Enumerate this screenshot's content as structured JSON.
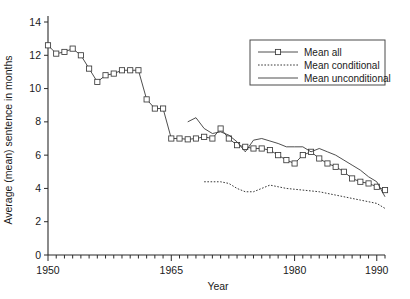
{
  "chart_data": {
    "type": "line",
    "title": "",
    "xlabel": "Year",
    "ylabel": "Average (mean) sentence in months",
    "xlim": [
      1950,
      1991
    ],
    "ylim": [
      0,
      14
    ],
    "xticks": [
      1950,
      1965,
      1980,
      1990
    ],
    "xtick_labels": [
      "1950",
      "1965",
      "1980",
      "1990"
    ],
    "x_minor_tick_interval": 1,
    "yticks": [
      0,
      2,
      4,
      6,
      8,
      10,
      12,
      14
    ],
    "ytick_labels": [
      "0",
      "2",
      "4",
      "6",
      "8",
      "10",
      "12",
      "14"
    ],
    "grid": false,
    "legend_position": "top-right",
    "series": [
      {
        "name": "Mean all",
        "style": "line-with-square-markers",
        "x": [
          1950,
          1951,
          1952,
          1953,
          1954,
          1955,
          1956,
          1957,
          1958,
          1959,
          1960,
          1961,
          1962,
          1963,
          1964,
          1965,
          1966,
          1967,
          1968,
          1969,
          1970,
          1971,
          1972,
          1973,
          1974,
          1975,
          1976,
          1977,
          1978,
          1979,
          1980,
          1981,
          1982,
          1983,
          1984,
          1985,
          1986,
          1987,
          1988,
          1989,
          1990,
          1991
        ],
        "values": [
          12.6,
          12.1,
          12.2,
          12.4,
          12.0,
          11.2,
          10.4,
          10.8,
          10.9,
          11.1,
          11.1,
          11.1,
          9.35,
          8.8,
          8.8,
          7.0,
          7.0,
          6.95,
          7.0,
          7.1,
          7.0,
          7.6,
          7.0,
          6.6,
          6.5,
          6.4,
          6.4,
          6.3,
          6.0,
          5.7,
          5.5,
          6.0,
          6.2,
          5.8,
          5.5,
          5.3,
          5.0,
          4.6,
          4.4,
          4.3,
          4.1,
          3.9
        ],
        "marker": "square"
      },
      {
        "name": "Mean conditional",
        "style": "dotted",
        "x": [
          1969,
          1970,
          1971,
          1972,
          1973,
          1974,
          1975,
          1976,
          1977,
          1978,
          1979,
          1980,
          1981,
          1982,
          1983,
          1984,
          1985,
          1986,
          1987,
          1988,
          1989,
          1990,
          1991
        ],
        "values": [
          4.4,
          4.4,
          4.4,
          4.3,
          4.0,
          3.8,
          3.8,
          4.0,
          4.2,
          4.1,
          4.0,
          3.95,
          3.9,
          3.85,
          3.8,
          3.7,
          3.6,
          3.5,
          3.4,
          3.3,
          3.2,
          3.1,
          2.8
        ],
        "marker": "none"
      },
      {
        "name": "Mean unconditional",
        "style": "solid",
        "x": [
          1967,
          1968,
          1969,
          1970,
          1971,
          1972,
          1973,
          1974,
          1975,
          1976,
          1977,
          1978,
          1979,
          1980,
          1981,
          1982,
          1983,
          1984,
          1985,
          1986,
          1987,
          1988,
          1989,
          1990,
          1991
        ],
        "values": [
          8.0,
          8.25,
          7.6,
          7.3,
          7.4,
          7.2,
          6.8,
          6.2,
          6.9,
          7.0,
          6.85,
          6.7,
          6.5,
          6.5,
          6.5,
          6.2,
          6.4,
          6.2,
          6.0,
          5.7,
          5.4,
          5.1,
          4.7,
          4.4,
          3.5
        ],
        "marker": "none"
      }
    ],
    "legend_entries": [
      {
        "label": "Mean all",
        "style": "line-with-square-markers"
      },
      {
        "label": "Mean conditional",
        "style": "dotted"
      },
      {
        "label": "Mean unconditional",
        "style": "solid"
      }
    ]
  }
}
